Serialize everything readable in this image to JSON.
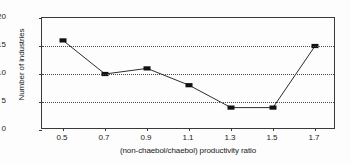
{
  "chart_data": {
    "type": "line",
    "title": "",
    "xlabel": "(non-chaebol/chaebol) productivity ratio",
    "ylabel": "Number of industries",
    "x": [
      0.5,
      0.7,
      0.9,
      1.1,
      1.3,
      1.5,
      1.7
    ],
    "values": [
      16,
      10,
      11,
      8,
      4,
      4,
      15
    ],
    "xtick_labels": [
      "0.5",
      "0.7",
      "0.9",
      "1.1",
      "1.3",
      "1.5",
      "1.7"
    ],
    "ytick_labels": [
      "0",
      "5",
      "10",
      "15",
      "20"
    ],
    "ytick_values": [
      0,
      5,
      10,
      15,
      20
    ],
    "xlim": [
      0.4,
      1.8
    ],
    "ylim": [
      0,
      20
    ],
    "grid": "horizontal-dotted",
    "legend": "none",
    "marker": "square",
    "line_color": "#2b2b2b",
    "marker_color": "#111111",
    "grid_color": "#4a4a4a",
    "axis_color": "#3a3a3a",
    "background": "#fdfdfd"
  }
}
